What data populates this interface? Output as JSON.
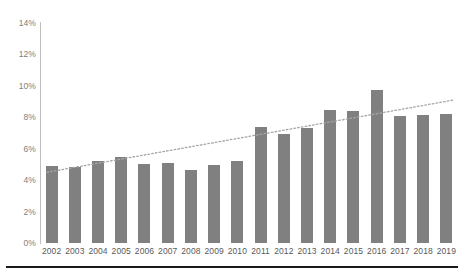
{
  "chart_data": {
    "type": "bar",
    "title": "",
    "subtitle": "",
    "xlabel": "",
    "ylabel": "",
    "categories": [
      "2002",
      "2003",
      "2004",
      "2005",
      "2006",
      "2007",
      "2008",
      "2009",
      "2010",
      "2011",
      "2012",
      "2013",
      "2014",
      "2015",
      "2016",
      "2017",
      "2018",
      "2019"
    ],
    "values": [
      4.9,
      4.85,
      5.2,
      5.5,
      5.0,
      5.1,
      4.65,
      4.95,
      5.2,
      7.4,
      6.95,
      7.3,
      8.45,
      8.4,
      9.75,
      8.1,
      8.15,
      8.2
    ],
    "value_unit": "%",
    "ylim": [
      0,
      14
    ],
    "ytick_values": [
      0,
      2,
      4,
      6,
      8,
      10,
      12,
      14
    ],
    "ytick_labels": [
      "0%",
      "2%",
      "4%",
      "6%",
      "8%",
      "10%",
      "12%",
      "14%"
    ],
    "grid": false,
    "legend": null,
    "legend_position": "none",
    "series": [
      {
        "name": "",
        "values": [
          4.9,
          4.85,
          5.2,
          5.5,
          5.0,
          5.1,
          4.65,
          4.95,
          5.2,
          7.4,
          6.95,
          7.3,
          8.45,
          8.4,
          9.75,
          8.1,
          8.15,
          8.2
        ],
        "color": "#808080",
        "type": "bar"
      },
      {
        "name": "trendline",
        "type": "line",
        "style": "dotted",
        "color": "#a6a6a6",
        "start_value": 4.5,
        "end_value": 9.1
      }
    ],
    "annotations": []
  },
  "style": {
    "bar_color": "#808080",
    "trendline_color": "#a6a6a6",
    "axis_color": "#bfbfbf",
    "ytick_color": "#808080",
    "xtick_color": "#595959",
    "rule_color": "#1a1a1a",
    "background": "#ffffff"
  }
}
